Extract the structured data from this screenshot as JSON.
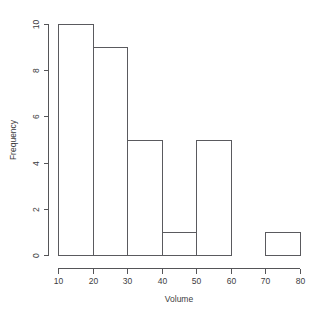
{
  "chart_data": {
    "type": "bar",
    "title": "",
    "xlabel": "Volume",
    "ylabel": "Frequency",
    "categories": [
      "10-20",
      "20-30",
      "30-40",
      "40-50",
      "50-60",
      "60-70",
      "70-80"
    ],
    "bin_edges": [
      10,
      20,
      30,
      40,
      50,
      60,
      70,
      80
    ],
    "values": [
      10,
      9,
      5,
      1,
      5,
      0,
      1
    ],
    "xlim": [
      10,
      80
    ],
    "ylim": [
      0,
      10
    ],
    "xticks": [
      "10",
      "20",
      "30",
      "40",
      "50",
      "60",
      "70",
      "80"
    ],
    "xtick_values": [
      10,
      20,
      30,
      40,
      50,
      60,
      70,
      80
    ],
    "yticks": [
      "0",
      "2",
      "4",
      "6",
      "8",
      "10"
    ],
    "ytick_values": [
      0,
      2,
      4,
      6,
      8,
      10
    ],
    "grid": false,
    "legend": false,
    "bar_fill_color": "#ffffff",
    "bar_border_color": "#5a5a5e",
    "axis_color": "#555558",
    "background_color": "#ffffff"
  },
  "figure": {
    "title_fragment": ""
  }
}
